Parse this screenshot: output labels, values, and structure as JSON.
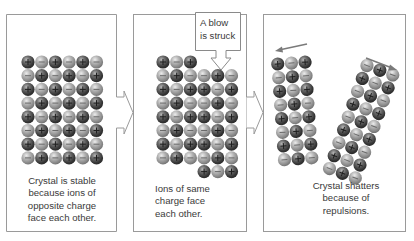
{
  "diagram": {
    "colors": {
      "panel_border": "#9a9a9a",
      "cation_dark": "#3f3f3f",
      "anion_light": "#a8a8a8",
      "arrow": "#7a7a7a",
      "text": "#3a3a3a"
    },
    "ion_legend": {
      "cation": {
        "symbol": "+",
        "shade": "dark"
      },
      "anion": {
        "symbol": "−",
        "shade": "light"
      }
    },
    "panels": [
      {
        "id": "stable",
        "caption_lines": [
          "Crystal is stable",
          "because ions of",
          "opposite charge",
          "face each other."
        ],
        "grid": {
          "columns": 6,
          "rows": 8,
          "pattern": "checkerboard",
          "first_ion": "+"
        }
      },
      {
        "id": "struck",
        "callout_lines": [
          "A blow",
          "is struck"
        ],
        "caption_lines": [
          "Ions of same",
          "charge face",
          "each other."
        ],
        "grid": {
          "columns": 6,
          "rows": 9,
          "shifted_columns": [
            3,
            4,
            5
          ],
          "shift_rows": 1
        }
      },
      {
        "id": "shattered",
        "caption_lines": [
          "Crystal shatters",
          "because of",
          "repulsions."
        ],
        "fragments": [
          {
            "columns": 3,
            "rows": 8,
            "direction": "left",
            "arrow": "left-arrow"
          },
          {
            "columns": 3,
            "rows": 9,
            "direction": "right",
            "arrow": "right-arrow"
          }
        ]
      }
    ],
    "connectors": [
      "arrow-right",
      "arrow-right"
    ]
  }
}
